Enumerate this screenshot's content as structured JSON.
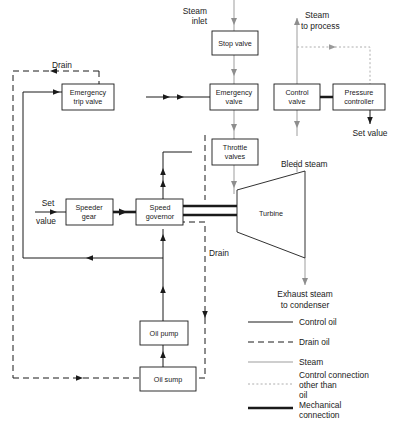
{
  "diagram": {
    "boxes": [
      {
        "id": "stop-valve",
        "label1": "Stop valve",
        "label2": ""
      },
      {
        "id": "emergency-valve",
        "label1": "Emergency",
        "label2": "valve"
      },
      {
        "id": "control-valve",
        "label1": "Control",
        "label2": "valve"
      },
      {
        "id": "pressure-controller",
        "label1": "Pressure",
        "label2": "controller"
      },
      {
        "id": "emergency-trip-valve",
        "label1": "Emergency",
        "label2": "trip valve"
      },
      {
        "id": "throttle-valves",
        "label1": "Throttle",
        "label2": "valves"
      },
      {
        "id": "speeder-gear",
        "label1": "Speeder",
        "label2": "gear"
      },
      {
        "id": "speed-governor",
        "label1": "Speed",
        "label2": "governor"
      },
      {
        "id": "oil-pump",
        "label1": "Oil pump",
        "label2": ""
      },
      {
        "id": "oil-sump",
        "label1": "Oil sump",
        "label2": ""
      }
    ],
    "turbine_label": "Turbine",
    "annotations": [
      {
        "id": "steam-inlet",
        "line1": "Steam",
        "line2": "inlet"
      },
      {
        "id": "steam-to-process",
        "line1": "Steam",
        "line2": "to process"
      },
      {
        "id": "drain-top",
        "line1": "Drain",
        "line2": ""
      },
      {
        "id": "set-value-right",
        "line1": "Set value",
        "line2": ""
      },
      {
        "id": "bleed-steam",
        "line1": "Bleed steam",
        "line2": ""
      },
      {
        "id": "set-value-left",
        "line1": "Set",
        "line2": "value"
      },
      {
        "id": "drain-mid",
        "line1": "Drain",
        "line2": ""
      },
      {
        "id": "exhaust-steam",
        "line1": "Exhaust steam",
        "line2": "to condenser"
      }
    ],
    "legend": [
      {
        "id": "control-oil",
        "style": "control",
        "line1": "Control oil",
        "line2": "",
        "line3": ""
      },
      {
        "id": "drain-oil",
        "style": "drain",
        "line1": "Drain oil",
        "line2": "",
        "line3": ""
      },
      {
        "id": "steam",
        "style": "steam",
        "line1": "Steam",
        "line2": "",
        "line3": ""
      },
      {
        "id": "control-connection",
        "style": "dotted",
        "line1": "Control connection",
        "line2": "other than",
        "line3": "oil"
      },
      {
        "id": "mechanical",
        "style": "mech",
        "line1": "Mechanical",
        "line2": "connection",
        "line3": ""
      }
    ],
    "colors": {
      "ink": "#1a1a1a",
      "steam": "#8d8d8d",
      "dotted": "#9a9a9a",
      "background": "#ffffff"
    }
  }
}
